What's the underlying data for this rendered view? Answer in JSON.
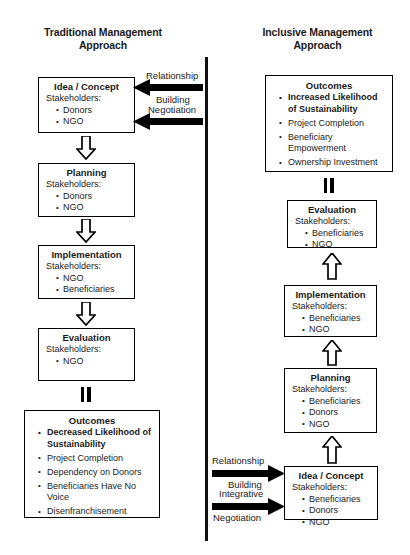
{
  "titles": {
    "left": "Traditional Management\nApproach",
    "left_line1": "Traditional Management",
    "left_line2": "Approach",
    "right_line1": "Inclusive Management",
    "right_line2": "Approach"
  },
  "labels": {
    "stakeholders": "Stakeholders:",
    "equals": "="
  },
  "colors": {
    "ink": "#000000",
    "background": "#ffffff",
    "divider": "#111111"
  },
  "traditional": {
    "idea": {
      "title": "Idea / Concept",
      "stakeholders_label": "Stakeholders:",
      "stakeholders": [
        "Donors",
        "NGO"
      ]
    },
    "planning": {
      "title": "Planning",
      "stakeholders_label": "Stakeholders:",
      "stakeholders": [
        "Donors",
        "NGO"
      ]
    },
    "implementation": {
      "title": "Implementation",
      "stakeholders_label": "Stakeholders:",
      "stakeholders": [
        "NGO",
        "Beneficiaries"
      ]
    },
    "evaluation": {
      "title": "Evaluation",
      "stakeholders_label": "Stakeholders:",
      "stakeholders": [
        "NGO"
      ]
    },
    "outcomes": {
      "title": "Outcomes",
      "items": [
        "Decreased Likelihood of Sustainability",
        "Project Completion",
        "Dependency on Donors",
        "Beneficiaries Have No Voice",
        "Disenfranchisement"
      ]
    },
    "arrows": {
      "top_line1": "Relationship",
      "top_line2": "Building",
      "bottom_line1": "Negotiation"
    }
  },
  "inclusive": {
    "outcomes": {
      "title": "Outcomes",
      "items": [
        "Increased Likelihood of Sustainability",
        "Project Completion",
        "Beneficiary Empowerment",
        "Ownership Investment"
      ]
    },
    "evaluation": {
      "title": "Evaluation",
      "stakeholders_label": "Stakeholders:",
      "stakeholders": [
        "Beneficiaries",
        "NGO"
      ]
    },
    "implementation": {
      "title": "Implementation",
      "stakeholders_label": "Stakeholders:",
      "stakeholders": [
        "Beneficiaries",
        "NGO"
      ]
    },
    "planning": {
      "title": "Planning",
      "stakeholders_label": "Stakeholders:",
      "stakeholders": [
        "Beneficiaries",
        "Donors",
        "NGO"
      ]
    },
    "idea": {
      "title": "Idea / Concept",
      "stakeholders_label": "Stakeholders:",
      "stakeholders": [
        "Beneficiaries",
        "Donors",
        "NGO"
      ]
    },
    "arrows": {
      "top_line1": "Relationship",
      "top_line2": "Building",
      "bottom_line1": "Integrative",
      "bottom_line2": "Negotiation"
    }
  }
}
